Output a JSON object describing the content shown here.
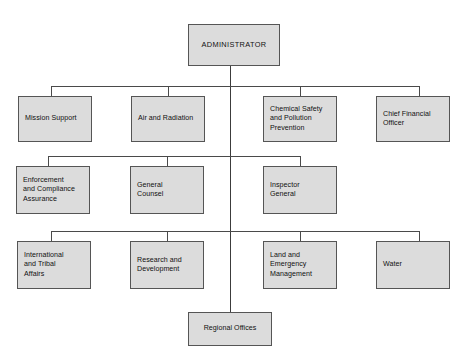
{
  "chart": {
    "type": "org-chart",
    "box_fill": "#dcdcdc",
    "box_border": "#555555",
    "connector_color": "#4a4a4a",
    "background": "#ffffff"
  },
  "root": {
    "label": "ADMINISTRATOR"
  },
  "rows": [
    {
      "row_index": 1,
      "nodes": [
        {
          "label": "Mission Support"
        },
        {
          "label": "Air and Radiation"
        },
        {
          "label": "Chemical Safety\nand Pollution\nPrevention"
        },
        {
          "label": "Chief Financial\nOfficer"
        }
      ]
    },
    {
      "row_index": 2,
      "nodes": [
        {
          "label": "Enforcement\nand Compliance\nAssurance"
        },
        {
          "label": "General\nCounsel"
        },
        {
          "label": "Inspector\nGeneral"
        }
      ]
    },
    {
      "row_index": 3,
      "nodes": [
        {
          "label": "International\nand Tribal\nAffairs"
        },
        {
          "label": "Research and\nDevelopment"
        },
        {
          "label": "Land and\nEmergency\nManagement"
        },
        {
          "label": "Water"
        }
      ]
    }
  ],
  "bottom": {
    "label": "Regional  Offices"
  }
}
